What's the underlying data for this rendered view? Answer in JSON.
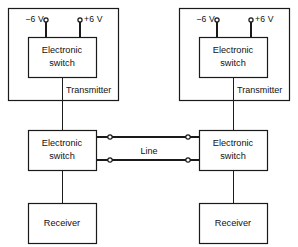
{
  "diagram": {
    "stroke_color": "#1a1a1a",
    "background_color": "#ffffff",
    "units": [
      {
        "side": "left",
        "supply_negative": "−6 V",
        "supply_positive": "+6 V",
        "transmitter_switch": "Electronic\nswitch",
        "transmitter_switch_line1": "Electronic",
        "transmitter_switch_line2": "switch",
        "transmitter_label": "Transmitter",
        "receiver_switch_line1": "Electronic",
        "receiver_switch_line2": "switch",
        "receiver_label": "Receiver"
      },
      {
        "side": "right",
        "supply_negative": "−6 V",
        "supply_positive": "+6 V",
        "transmitter_switch": "Electronic\nswitch",
        "transmitter_switch_line1": "Electronic",
        "transmitter_switch_line2": "switch",
        "transmitter_label": "Transmitter",
        "receiver_switch_line1": "Electronic",
        "receiver_switch_line2": "switch",
        "receiver_label": "Receiver"
      }
    ],
    "line_label": "Line",
    "terminal_count": 4
  }
}
